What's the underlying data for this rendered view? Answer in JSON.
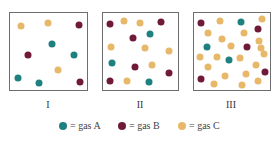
{
  "colors": {
    "A": "#1f8080",
    "B": "#701a3a",
    "C": "#e8b86a",
    "border": "#6e6e6e"
  },
  "panels": [
    {
      "label": "I",
      "box": [
        9,
        12,
        79,
        79
      ],
      "label_x": 48,
      "dots": [
        [
          "C",
          21,
          26
        ],
        [
          "C",
          48,
          23
        ],
        [
          "B",
          79,
          25
        ],
        [
          "A",
          52,
          44
        ],
        [
          "B",
          28,
          55
        ],
        [
          "A",
          74,
          55
        ],
        [
          "C",
          58,
          70
        ],
        [
          "A",
          18,
          78
        ],
        [
          "A",
          39,
          83
        ],
        [
          "B",
          80,
          82
        ]
      ]
    },
    {
      "label": "II",
      "box": [
        102,
        12,
        77,
        79
      ],
      "label_x": 140,
      "dots": [
        [
          "B",
          110,
          24
        ],
        [
          "C",
          124,
          21
        ],
        [
          "C",
          140,
          23
        ],
        [
          "B",
          161,
          22
        ],
        [
          "B",
          133,
          38
        ],
        [
          "A",
          150,
          34
        ],
        [
          "C",
          111,
          47
        ],
        [
          "C",
          145,
          48
        ],
        [
          "C",
          169,
          51
        ],
        [
          "A",
          112,
          63
        ],
        [
          "B",
          135,
          67
        ],
        [
          "C",
          152,
          65
        ],
        [
          "B",
          169,
          73
        ],
        [
          "B",
          110,
          81
        ],
        [
          "C",
          127,
          81
        ],
        [
          "A",
          149,
          82
        ]
      ]
    },
    {
      "label": "III",
      "box": [
        193,
        12,
        78,
        79
      ],
      "label_x": 231,
      "dots": [
        [
          "B",
          201,
          23
        ],
        [
          "C",
          220,
          21
        ],
        [
          "A",
          241,
          22
        ],
        [
          "C",
          262,
          19
        ],
        [
          "C",
          208,
          33
        ],
        [
          "C",
          244,
          33
        ],
        [
          "B",
          258,
          29
        ],
        [
          "C",
          222,
          39
        ],
        [
          "C",
          259,
          41
        ],
        [
          "A",
          207,
          47
        ],
        [
          "C",
          231,
          46
        ],
        [
          "B",
          247,
          47
        ],
        [
          "C",
          261,
          48
        ],
        [
          "C",
          200,
          57
        ],
        [
          "C",
          217,
          57
        ],
        [
          "A",
          229,
          60
        ],
        [
          "C",
          240,
          58
        ],
        [
          "C",
          264,
          54
        ],
        [
          "C",
          208,
          67
        ],
        [
          "C",
          256,
          65
        ],
        [
          "C",
          225,
          76
        ],
        [
          "C",
          246,
          74
        ],
        [
          "B",
          265,
          72
        ],
        [
          "B",
          201,
          79
        ],
        [
          "C",
          214,
          84
        ],
        [
          "C",
          242,
          85
        ],
        [
          "C",
          258,
          81
        ]
      ]
    }
  ],
  "panel_label_y": 99,
  "legend": [
    {
      "key": "A",
      "text": "= gas A",
      "x": 59
    },
    {
      "key": "B",
      "text": "= gas B",
      "x": 118
    },
    {
      "key": "C",
      "text": "= gas C",
      "x": 178
    }
  ]
}
